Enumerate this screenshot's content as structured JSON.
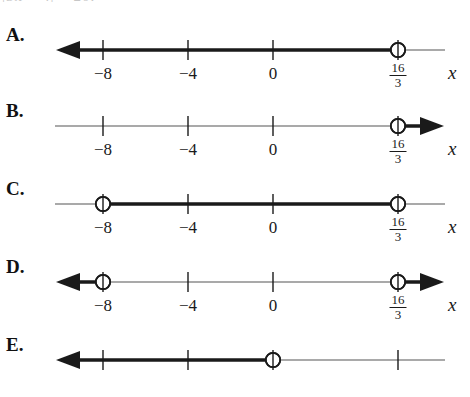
{
  "stem": {
    "clipped_text": "|3x + 4| > 20."
  },
  "axis": {
    "variable_label": "x",
    "tick_labels": [
      "−8",
      "−4",
      "0"
    ],
    "fraction_label": {
      "numerator": "16",
      "denominator": "3"
    },
    "tick_values": [
      -8,
      -4,
      0,
      5.333
    ],
    "x_positions": [
      103,
      188,
      273,
      398
    ],
    "line_start_px": 55,
    "line_end_px": 445,
    "colors": {
      "ink": "#1a1a1a",
      "thin_line": "#555555",
      "background": "#ffffff"
    }
  },
  "choices": [
    {
      "letter": "A.",
      "name": "choice-a",
      "top": 24,
      "graph": {
        "open_circles": [
          398
        ],
        "thick_segments": [
          [
            62,
            398
          ]
        ],
        "thin_segments": [
          [
            398,
            445
          ]
        ],
        "arrows": [
          "left"
        ],
        "ticks": [
          103,
          188,
          273
        ],
        "show_tick_labels": true
      }
    },
    {
      "letter": "B.",
      "name": "choice-b",
      "top": 100,
      "graph": {
        "open_circles": [
          398
        ],
        "thick_segments": [
          [
            398,
            438
          ]
        ],
        "thin_segments": [
          [
            55,
            398
          ]
        ],
        "arrows": [
          "right"
        ],
        "ticks": [
          103,
          188,
          273
        ],
        "show_tick_labels": true
      }
    },
    {
      "letter": "C.",
      "name": "choice-c",
      "top": 178,
      "graph": {
        "open_circles": [
          103,
          398
        ],
        "thick_segments": [
          [
            103,
            398
          ]
        ],
        "thin_segments": [
          [
            55,
            103
          ],
          [
            398,
            445
          ]
        ],
        "arrows": [],
        "ticks": [
          188,
          273
        ],
        "show_tick_labels": true
      }
    },
    {
      "letter": "D.",
      "name": "choice-d",
      "top": 256,
      "graph": {
        "open_circles": [
          103,
          398
        ],
        "thick_segments": [
          [
            62,
            103
          ],
          [
            398,
            438
          ]
        ],
        "thin_segments": [
          [
            103,
            398
          ]
        ],
        "arrows": [
          "left",
          "right"
        ],
        "ticks": [
          188,
          273
        ],
        "show_tick_labels": true
      }
    },
    {
      "letter": "E.",
      "name": "choice-e",
      "top": 334,
      "graph": {
        "open_circles": [
          273
        ],
        "thick_segments": [
          [
            62,
            273
          ]
        ],
        "thin_segments": [
          [
            273,
            445
          ]
        ],
        "arrows": [
          "left"
        ],
        "ticks": [
          103,
          188,
          398
        ],
        "show_tick_labels": false
      }
    }
  ]
}
